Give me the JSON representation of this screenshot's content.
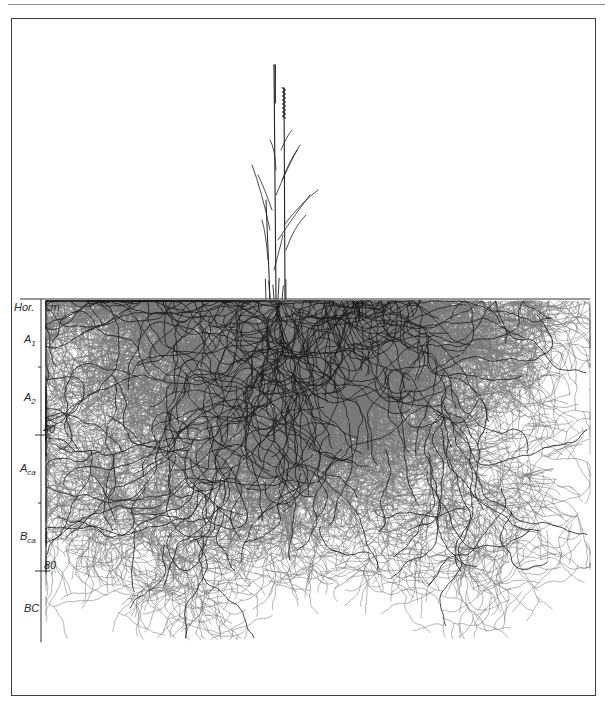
{
  "figure": {
    "type": "root-system-profile-drawing",
    "frame": {
      "left": 11,
      "top": 18,
      "right": 596,
      "bottom": 696
    }
  },
  "axis": {
    "header_label": "Hor.",
    "unit_label": "cm",
    "ticks": [
      {
        "depth_cm": 0,
        "label": ""
      },
      {
        "depth_cm": 20,
        "label": ""
      },
      {
        "depth_cm": 40,
        "label": "40"
      },
      {
        "depth_cm": 60,
        "label": ""
      },
      {
        "depth_cm": 80,
        "label": "80"
      }
    ],
    "max_depth_cm": 101,
    "px_per_cm": 3.4,
    "surface_y": 299,
    "axis_x": 41
  },
  "horizons": [
    {
      "name": "A",
      "sub": "1",
      "y": 340
    },
    {
      "name": "A",
      "sub": "2",
      "y": 398
    },
    {
      "name": "A",
      "sub": "ca",
      "y": 470
    },
    {
      "name": "B",
      "sub": "ca",
      "y": 537
    },
    {
      "name": "BC",
      "sub": "",
      "y": 609
    }
  ],
  "labels": {
    "hor": "Hor.",
    "cm": "cm",
    "tick_40": "40",
    "tick_80": "80",
    "h_a1_main": "A",
    "h_a1_sub": "1",
    "h_a2_main": "A",
    "h_a2_sub": "2",
    "h_aca_main": "A",
    "h_aca_sub": "ca",
    "h_bca_main": "B",
    "h_bca_sub": "ca",
    "h_bc_main": "BC"
  },
  "plant": {
    "base_x": 280,
    "culms": [
      {
        "x_base": 276,
        "top_y": 65,
        "spike_len": 40
      },
      {
        "x_base": 285,
        "top_y": 88,
        "spike_len": 32
      }
    ],
    "root_extent": {
      "left_x": 46,
      "right_x": 590,
      "max_y": 640
    }
  },
  "colors": {
    "ink": "#1a1a1a",
    "ink_light": "#6a6a6a",
    "frame": "#3c3c3c",
    "background": "#ffffff"
  }
}
